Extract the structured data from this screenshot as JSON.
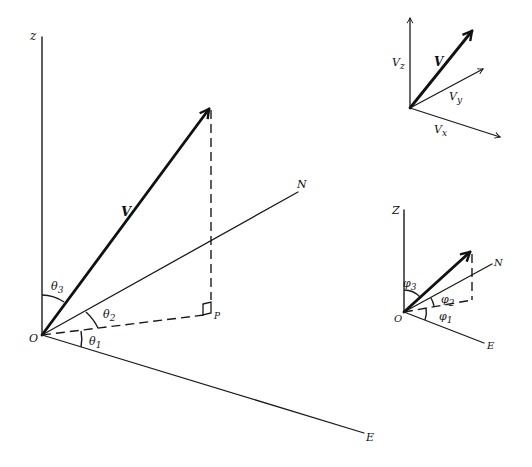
{
  "figure": {
    "colors": {
      "ink": "#111111",
      "background": "#ffffff"
    }
  },
  "main_diagram": {
    "origin_label": "O",
    "z_axis_label": "z",
    "n_axis_label": "N",
    "e_axis_label": "E",
    "vector_label": "V",
    "projection_point_label": "P",
    "angles": {
      "theta1": {
        "base": "θ",
        "sub": "1"
      },
      "theta2": {
        "base": "θ",
        "sub": "2"
      },
      "theta3": {
        "base": "θ",
        "sub": "3"
      }
    }
  },
  "components_inset": {
    "vector_label": "V",
    "vz": {
      "base": "V",
      "sub": "z"
    },
    "vy": {
      "base": "V",
      "sub": "y"
    },
    "vx": {
      "base": "V",
      "sub": "x"
    }
  },
  "angle_inset": {
    "origin_label": "O",
    "z_axis_label": "Z",
    "n_axis_label": "N",
    "e_axis_label": "E",
    "angles": {
      "phi1": {
        "base": "φ",
        "sub": "1"
      },
      "phi2": {
        "base": "φ",
        "sub": "2"
      },
      "phi3": {
        "base": "φ",
        "sub": "3"
      }
    }
  }
}
